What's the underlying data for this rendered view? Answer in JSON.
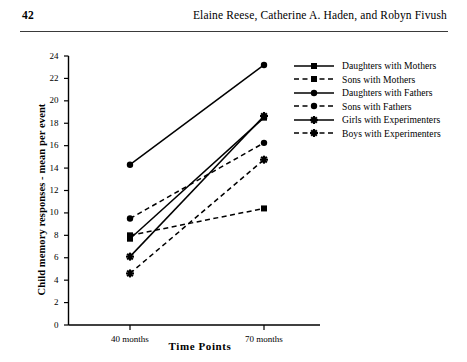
{
  "header": {
    "page_number": "42",
    "running_title": "Elaine Reese, Catherine A. Haden, and Robyn Fivush"
  },
  "chart_data": {
    "type": "line",
    "title": "",
    "xlabel": "Time Points",
    "ylabel": "Child memory responses - mean per event",
    "categories": [
      "40 months",
      "70 months"
    ],
    "x_tick_labels": [
      "40 months",
      "70 months"
    ],
    "y_tick_labels": [
      "0",
      "2",
      "4",
      "6",
      "8",
      "10",
      "12",
      "14",
      "16",
      "18",
      "20",
      "22",
      "24"
    ],
    "ylim": [
      0,
      24
    ],
    "y_tick_step": 2,
    "grid": false,
    "legend_position": "right",
    "series": [
      {
        "name": "Daughters with Mothers",
        "values": [
          7.7,
          18.5
        ],
        "style": "solid",
        "marker": "square",
        "color": "#000000"
      },
      {
        "name": "Sons with Mothers",
        "values": [
          8.0,
          10.4
        ],
        "style": "dashed",
        "marker": "square",
        "color": "#000000"
      },
      {
        "name": "Daughters with Fathers",
        "values": [
          14.3,
          23.2
        ],
        "style": "solid",
        "marker": "circle",
        "color": "#000000"
      },
      {
        "name": "Sons with Fathers",
        "values": [
          9.5,
          16.25
        ],
        "style": "dashed",
        "marker": "circle",
        "color": "#000000"
      },
      {
        "name": "Girls with Experimenters",
        "values": [
          6.1,
          18.65
        ],
        "style": "solid",
        "marker": "star",
        "color": "#000000"
      },
      {
        "name": "Boys with Experimenters",
        "values": [
          4.6,
          14.75
        ],
        "style": "dashed",
        "marker": "star",
        "color": "#000000"
      }
    ]
  }
}
